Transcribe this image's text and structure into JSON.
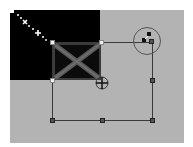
{
  "editor": {
    "canvas_background": "#b3b3b3",
    "layer_background": "#000000",
    "tool": "transform",
    "selection": {
      "left": 52,
      "top": 42,
      "right": 152,
      "bottom": 120,
      "handles": [
        "top-left",
        "top-middle",
        "top-right",
        "middle-left",
        "middle-right",
        "bottom-left",
        "bottom-middle",
        "bottom-right"
      ]
    },
    "icons": {
      "rotate_handle": "rotate-icon",
      "move_cursor": "move-crosshair-icon",
      "sparkle": "sparkle-icon"
    }
  }
}
